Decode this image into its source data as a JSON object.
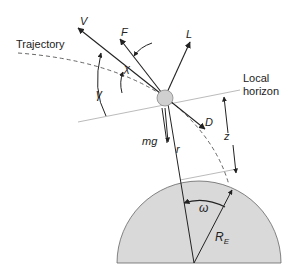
{
  "diagram": {
    "colors": {
      "earth_fill": "#d9d9d9",
      "earth_stroke": "#555555",
      "line": "#222222",
      "horizon": "#bbbbbb",
      "vehicle_fill": "#d0d0d0"
    },
    "labels": {
      "trajectory": "Trajectory",
      "local_horizon_1": "Local",
      "local_horizon_2": "horizon",
      "velocity": "V",
      "thrust": "F",
      "lift": "L",
      "drag": "D",
      "weight": "mg",
      "radius": "r",
      "altitude": "z",
      "earth_radius": "R",
      "earth_radius_sub": "E",
      "flight_path_angle": "γ",
      "thrust_angle": "χ",
      "range_angle": "ω"
    }
  }
}
